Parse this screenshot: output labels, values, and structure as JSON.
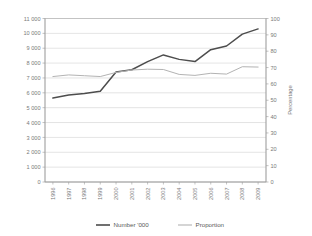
{
  "chart_data": {
    "type": "line",
    "title": "",
    "subtitle": "",
    "xlabel": "",
    "ylabel": "",
    "y2label": "Percentage",
    "grid": true,
    "legend_position": "bottom",
    "categories": [
      "1996",
      "1997",
      "1998",
      "1999",
      "2000",
      "2001",
      "2002",
      "2003",
      "2004",
      "2005",
      "2006",
      "2007",
      "2008",
      "2009"
    ],
    "x_tick_labels": [
      "1996",
      "1997",
      "1998",
      "1999",
      "2000",
      "2001",
      "2002",
      "2003",
      "2004",
      "2005",
      "2006",
      "2007",
      "2008",
      "2009"
    ],
    "y_tick_labels": [
      "0",
      "1 000",
      "2 000",
      "3 000",
      "4 000",
      "5 000",
      "6 000",
      "7 000",
      "8 000",
      "9 000",
      "10 000",
      "11 000"
    ],
    "y_tick_values": [
      0,
      1000,
      2000,
      3000,
      4000,
      5000,
      6000,
      7000,
      8000,
      9000,
      10000,
      11000
    ],
    "ylim": [
      0,
      11000
    ],
    "y2_tick_labels": [
      "0",
      "10",
      "20",
      "30",
      "40",
      "50",
      "60",
      "70",
      "80",
      "90",
      "100"
    ],
    "y2_tick_values": [
      0,
      10,
      20,
      30,
      40,
      50,
      60,
      70,
      80,
      90,
      100
    ],
    "y2lim": [
      0,
      100
    ],
    "series": [
      {
        "name": "Number '000",
        "axis": "left",
        "color": "#4d4d4d",
        "values": [
          5650,
          5850,
          5950,
          6100,
          7400,
          7550,
          8100,
          8550,
          8250,
          8100,
          8900,
          9150,
          9950,
          10300
        ]
      },
      {
        "name": "Proportion",
        "axis": "right",
        "color": "#b3b3b3",
        "values": [
          64.5,
          65.5,
          65.0,
          64.5,
          67.0,
          68.5,
          69.0,
          68.8,
          65.8,
          65.2,
          66.5,
          66.0,
          70.5,
          70.3
        ]
      }
    ],
    "legend": [
      {
        "label": "Number '000",
        "color": "#4d4d4d",
        "width": 1.6
      },
      {
        "label": "Proportion",
        "color": "#b3b3b3",
        "width": 1.1
      }
    ]
  },
  "colors": {
    "background": "#ffffff",
    "gridline": "#c9c9c9",
    "axis": "#9a9a9a",
    "text": "#7a7a7a",
    "series_number": "#4d4d4d",
    "series_proportion": "#b3b3b3"
  }
}
